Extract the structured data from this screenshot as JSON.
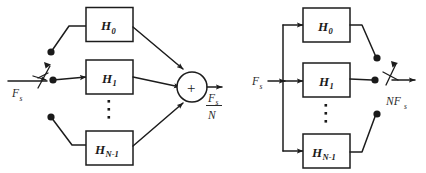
{
  "figure": {
    "background_color": "#ffffff",
    "line_color": "#1c1c1c",
    "text_color": "#1a1a1a"
  },
  "left_diagram": {
    "name": "analysis-decimation-bank",
    "input_label": {
      "base": "F",
      "sub": "s"
    },
    "output_label": {
      "numerator_base": "F",
      "numerator_sub": "s",
      "denominator": "N"
    },
    "sum_symbol": "+",
    "ellipsis": "⋮",
    "blocks": [
      {
        "base": "H",
        "sub": "0"
      },
      {
        "base": "H",
        "sub": "1"
      },
      {
        "base": "H",
        "sub": "N-1"
      }
    ],
    "switch": {
      "name": "rotary-commutator-input",
      "poles": 3
    }
  },
  "right_diagram": {
    "name": "synthesis-interpolation-bank",
    "input_label": {
      "base": "F",
      "sub": "s"
    },
    "output_label": {
      "base": "NF",
      "sub": "s"
    },
    "ellipsis": "⋮",
    "blocks": [
      {
        "base": "H",
        "sub": "0"
      },
      {
        "base": "H",
        "sub": "1"
      },
      {
        "base": "H",
        "sub": "N-1"
      }
    ],
    "switch": {
      "name": "rotary-commutator-output",
      "poles": 3
    }
  }
}
